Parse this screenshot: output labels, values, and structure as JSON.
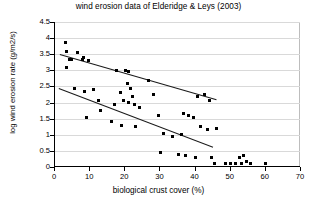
{
  "chart_data": {
    "type": "scatter",
    "title": "wind erosion data of Elderidge & Leys (2003)",
    "xlabel": "biological crust cover (%)",
    "ylabel": "log wind erosion rate (g/m2/s)",
    "xlim": [
      0,
      70
    ],
    "ylim": [
      0,
      4.5
    ],
    "xticks": [
      "0",
      "10",
      "20",
      "30",
      "40",
      "50",
      "60",
      "70"
    ],
    "yticks": [
      "0",
      "0.5",
      "1",
      "1.5",
      "2",
      "2.5",
      "3",
      "3.5",
      "4",
      "4.5"
    ],
    "grid": "horizontal",
    "legend": "none",
    "marker": "filled-square",
    "marker_color": "#000000",
    "points": [
      [
        3.0,
        3.85
      ],
      [
        3.2,
        3.6
      ],
      [
        4.0,
        3.35
      ],
      [
        4.6,
        3.35
      ],
      [
        3.4,
        3.1
      ],
      [
        6.5,
        3.55
      ],
      [
        7.8,
        3.35
      ],
      [
        8.0,
        3.4
      ],
      [
        9.5,
        3.3
      ],
      [
        5.5,
        2.45
      ],
      [
        8.5,
        2.35
      ],
      [
        11.0,
        2.4
      ],
      [
        12.5,
        2.05
      ],
      [
        9.0,
        1.55
      ],
      [
        13.0,
        1.75
      ],
      [
        17.5,
        3.0
      ],
      [
        20.0,
        3.0
      ],
      [
        21.0,
        2.95
      ],
      [
        20.5,
        2.6
      ],
      [
        21.5,
        2.45
      ],
      [
        22.0,
        2.2
      ],
      [
        18.5,
        2.3
      ],
      [
        19.5,
        2.05
      ],
      [
        21.0,
        2.0
      ],
      [
        17.0,
        1.95
      ],
      [
        22.5,
        1.95
      ],
      [
        24.0,
        1.85
      ],
      [
        16.0,
        1.4
      ],
      [
        19.0,
        1.3
      ],
      [
        23.0,
        1.25
      ],
      [
        26.5,
        2.7
      ],
      [
        28.0,
        2.25
      ],
      [
        29.5,
        1.6
      ],
      [
        31.0,
        1.05
      ],
      [
        33.5,
        0.95
      ],
      [
        36.0,
        1.0
      ],
      [
        30.0,
        0.45
      ],
      [
        35.0,
        0.4
      ],
      [
        36.5,
        1.65
      ],
      [
        38.0,
        1.6
      ],
      [
        39.5,
        1.55
      ],
      [
        40.5,
        2.2
      ],
      [
        42.5,
        2.25
      ],
      [
        44.0,
        2.05
      ],
      [
        41.5,
        1.25
      ],
      [
        43.5,
        1.15
      ],
      [
        37.0,
        0.35
      ],
      [
        40.0,
        0.3
      ],
      [
        44.5,
        0.3
      ],
      [
        45.5,
        0.12
      ],
      [
        48.5,
        0.1
      ],
      [
        50.0,
        0.12
      ],
      [
        51.5,
        0.1
      ],
      [
        52.5,
        0.3
      ],
      [
        53.5,
        0.35
      ],
      [
        53.0,
        0.12
      ],
      [
        54.5,
        0.18
      ],
      [
        55.5,
        0.1
      ],
      [
        60.0,
        0.12
      ],
      [
        36.5,
        1.65
      ],
      [
        46.0,
        1.2
      ]
    ],
    "trendlines": [
      {
        "name": "upper-regression",
        "x1": 1.5,
        "y1": 3.52,
        "x2": 46.0,
        "y2": 2.12
      },
      {
        "name": "lower-regression",
        "x1": 1.0,
        "y1": 2.45,
        "x2": 45.0,
        "y2": 0.62
      }
    ]
  }
}
